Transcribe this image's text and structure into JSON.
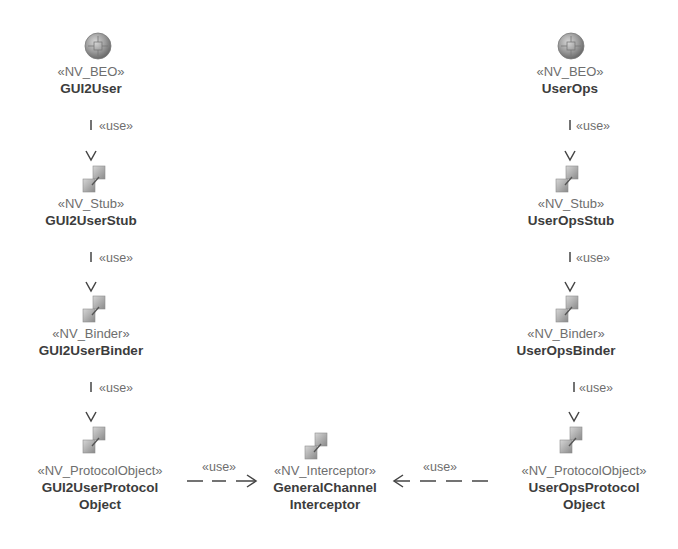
{
  "diagram": {
    "left_chain": [
      {
        "stereotype": "«NV_BEO»",
        "name": "GUI2User",
        "icon": "globe-icon"
      },
      {
        "stereotype": "«NV_Stub»",
        "name": "GUI2UserStub",
        "icon": "component-icon"
      },
      {
        "stereotype": "«NV_Binder»",
        "name": "GUI2UserBinder",
        "icon": "component-icon"
      },
      {
        "stereotype": "«NV_ProtocolObject»",
        "name": "GUI2UserProtocol",
        "name2": "Object",
        "icon": "component-icon"
      }
    ],
    "right_chain": [
      {
        "stereotype": "«NV_BEO»",
        "name": "UserOps",
        "icon": "globe-icon"
      },
      {
        "stereotype": "«NV_Stub»",
        "name": "UserOpsStub",
        "icon": "component-icon"
      },
      {
        "stereotype": "«NV_Binder»",
        "name": "UserOpsBinder",
        "icon": "component-icon"
      },
      {
        "stereotype": "«NV_ProtocolObject»",
        "name": "UserOpsProtocol",
        "name2": "Object",
        "icon": "component-icon"
      }
    ],
    "center": {
      "stereotype": "«NV_Interceptor»",
      "name": "GeneralChannel",
      "name2": "Interceptor",
      "icon": "component-icon"
    },
    "edge_label": "«use»",
    "edges": [
      {
        "from": "GUI2User",
        "to": "GUI2UserStub",
        "label": "«use»"
      },
      {
        "from": "GUI2UserStub",
        "to": "GUI2UserBinder",
        "label": "«use»"
      },
      {
        "from": "GUI2UserBinder",
        "to": "GUI2UserProtocolObject",
        "label": "«use»"
      },
      {
        "from": "GUI2UserProtocolObject",
        "to": "GeneralChannelInterceptor",
        "label": "«use»"
      },
      {
        "from": "UserOps",
        "to": "UserOpsStub",
        "label": "«use»"
      },
      {
        "from": "UserOpsStub",
        "to": "UserOpsBinder",
        "label": "«use»"
      },
      {
        "from": "UserOpsBinder",
        "to": "UserOpsProtocolObject",
        "label": "«use»"
      },
      {
        "from": "UserOpsProtocolObject",
        "to": "GeneralChannelInterceptor",
        "label": "«use»"
      }
    ]
  }
}
